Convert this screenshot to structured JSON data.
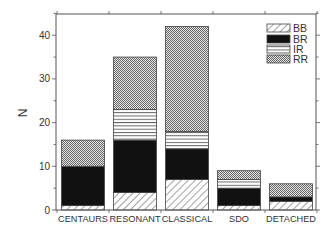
{
  "chart_data": {
    "type": "bar",
    "stacked": true,
    "title": "",
    "xlabel": "",
    "ylabel": "N",
    "ylim": [
      0,
      45
    ],
    "yticks": [
      0,
      10,
      20,
      30,
      40
    ],
    "grid": false,
    "legend_position": "upper right",
    "categories": [
      "CENTAURS",
      "RESONANT",
      "CLASSICAL",
      "SDO",
      "DETACHED"
    ],
    "series": [
      {
        "name": "BB",
        "pattern": "diagonal-hatch",
        "values": [
          1,
          4,
          7,
          1,
          2
        ]
      },
      {
        "name": "BR",
        "pattern": "solid-black",
        "values": [
          9,
          12,
          7,
          4,
          1
        ]
      },
      {
        "name": "IR",
        "pattern": "horizontal-lines",
        "values": [
          0,
          7,
          4,
          2,
          0
        ]
      },
      {
        "name": "RR",
        "pattern": "checker-gray",
        "values": [
          6,
          12,
          24,
          2,
          3
        ]
      }
    ],
    "totals": [
      16,
      35,
      42,
      9,
      6
    ]
  }
}
